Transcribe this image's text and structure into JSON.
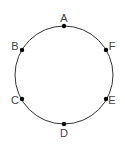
{
  "diagram": {
    "type": "circle-with-points",
    "circle": {
      "cx": 64,
      "cy": 75,
      "r": 49,
      "stroke": "#333333"
    },
    "point_color": "#000000",
    "label_color": "#444444",
    "points": [
      {
        "label": "A",
        "x": 64,
        "y": 26,
        "lx": 64,
        "ly": 22
      },
      {
        "label": "B",
        "x": 22,
        "y": 50,
        "lx": 15,
        "ly": 50
      },
      {
        "label": "C",
        "x": 22,
        "y": 99,
        "lx": 15,
        "ly": 104
      },
      {
        "label": "D",
        "x": 64,
        "y": 124,
        "lx": 64,
        "ly": 137
      },
      {
        "label": "E",
        "x": 106,
        "y": 99,
        "lx": 112,
        "ly": 104
      },
      {
        "label": "F",
        "x": 106,
        "y": 50,
        "lx": 112,
        "ly": 50
      }
    ]
  }
}
